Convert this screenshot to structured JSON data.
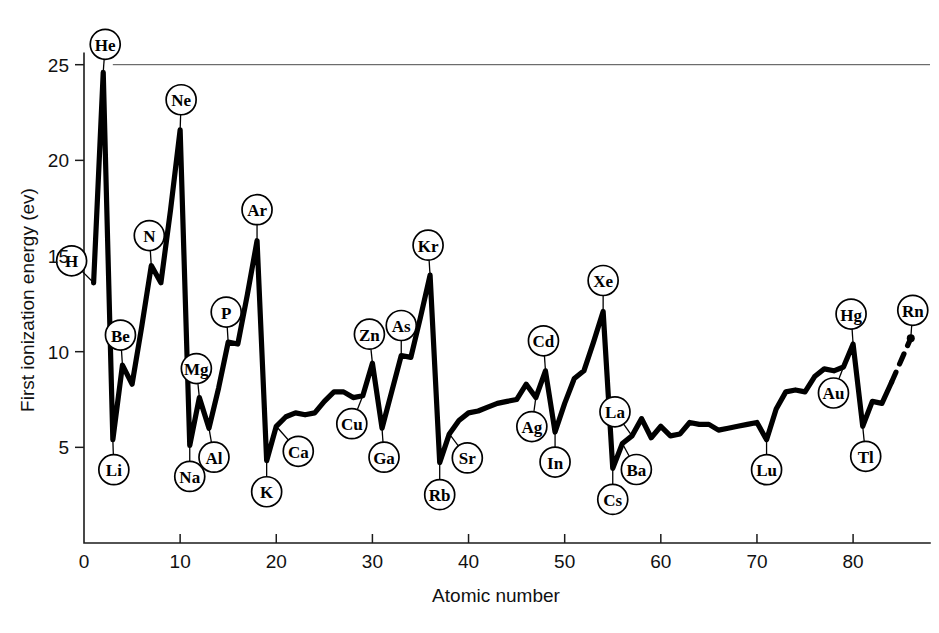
{
  "chart_data": {
    "type": "line",
    "title": "",
    "xlabel": "Atomic number",
    "ylabel": "First ionization energy (ev)",
    "xlim": [
      0,
      88
    ],
    "ylim": [
      0,
      26.5
    ],
    "xticks": [
      0,
      10,
      20,
      30,
      40,
      50,
      60,
      70,
      80
    ],
    "yticks": [
      5,
      10,
      15,
      20,
      25
    ],
    "xticklabels": [
      "0",
      "10",
      "20",
      "30",
      "40",
      "50",
      "60",
      "70",
      "80"
    ],
    "yticklabels": [
      "5",
      "10",
      "15",
      "20",
      "25"
    ],
    "grid": false,
    "legend": null,
    "reference_line": {
      "y": 25,
      "x_from": 3,
      "x_to": 88,
      "style": "thin-solid"
    },
    "series": [
      {
        "name": "First ionization energy",
        "style": "solid",
        "x": [
          1,
          2,
          3,
          4,
          5,
          6,
          7,
          8,
          9,
          10,
          11,
          12,
          13,
          14,
          15,
          16,
          17,
          18,
          19,
          20,
          21,
          22,
          23,
          24,
          25,
          26,
          27,
          28,
          29,
          30,
          31,
          32,
          33,
          34,
          35,
          36,
          37,
          38,
          39,
          40,
          41,
          42,
          43,
          44,
          45,
          46,
          47,
          48,
          49,
          50,
          51,
          52,
          53,
          54,
          55,
          56,
          57,
          58,
          59,
          60,
          61,
          62,
          63,
          64,
          65,
          66,
          67,
          68,
          69,
          70,
          71,
          72,
          73,
          74,
          75,
          76,
          77,
          78,
          79,
          80,
          81,
          82,
          83,
          84
        ],
        "y": [
          13.6,
          24.6,
          5.4,
          9.3,
          8.3,
          11.3,
          14.5,
          13.6,
          17.4,
          21.6,
          5.1,
          7.6,
          6.0,
          8.1,
          10.5,
          10.4,
          13.0,
          15.8,
          4.3,
          6.1,
          6.6,
          6.8,
          6.7,
          6.8,
          7.4,
          7.9,
          7.9,
          7.6,
          7.7,
          9.4,
          6.0,
          7.9,
          9.8,
          9.7,
          11.8,
          14.0,
          4.2,
          5.7,
          6.4,
          6.8,
          6.9,
          7.1,
          7.3,
          7.4,
          7.5,
          8.3,
          7.6,
          9.0,
          5.8,
          7.3,
          8.6,
          9.0,
          10.5,
          12.1,
          3.9,
          5.2,
          5.6,
          6.5,
          5.5,
          6.1,
          5.6,
          5.7,
          6.3,
          6.2,
          6.2,
          5.9,
          6.0,
          6.1,
          6.2,
          6.3,
          5.4,
          7.0,
          7.9,
          8.0,
          7.9,
          8.7,
          9.1,
          9.0,
          9.2,
          10.4,
          6.1,
          7.4,
          7.3,
          8.4
        ]
      },
      {
        "name": "Extrapolation to radon",
        "style": "dashed",
        "x": [
          84,
          86
        ],
        "y": [
          8.4,
          10.7
        ]
      }
    ],
    "point_labels": [
      {
        "element": "H",
        "atomic_number": 1,
        "energy": 13.6,
        "label_dx": -22,
        "label_dy": -22
      },
      {
        "element": "He",
        "atomic_number": 2,
        "energy": 24.6,
        "label_dx": 2,
        "label_dy": -28
      },
      {
        "element": "Li",
        "atomic_number": 3,
        "energy": 5.4,
        "label_dx": 1,
        "label_dy": 30
      },
      {
        "element": "Be",
        "atomic_number": 4,
        "energy": 9.3,
        "label_dx": -2,
        "label_dy": -30
      },
      {
        "element": "N",
        "atomic_number": 7,
        "energy": 14.5,
        "label_dx": -2,
        "label_dy": -30
      },
      {
        "element": "Ne",
        "atomic_number": 10,
        "energy": 21.6,
        "label_dx": 1,
        "label_dy": -30
      },
      {
        "element": "Na",
        "atomic_number": 11,
        "energy": 5.1,
        "label_dx": 0,
        "label_dy": 31
      },
      {
        "element": "Mg",
        "atomic_number": 12,
        "energy": 7.6,
        "label_dx": -3,
        "label_dy": -29
      },
      {
        "element": "Al",
        "atomic_number": 13,
        "energy": 6.0,
        "label_dx": 5,
        "label_dy": 29
      },
      {
        "element": "P",
        "atomic_number": 15,
        "energy": 10.5,
        "label_dx": -2,
        "label_dy": -30
      },
      {
        "element": "Ar",
        "atomic_number": 18,
        "energy": 15.8,
        "label_dx": 0,
        "label_dy": -31
      },
      {
        "element": "K",
        "atomic_number": 19,
        "energy": 4.3,
        "label_dx": 0,
        "label_dy": 31
      },
      {
        "element": "Ca",
        "atomic_number": 20,
        "energy": 6.1,
        "label_dx": 22,
        "label_dy": 25
      },
      {
        "element": "Cu",
        "atomic_number": 29,
        "energy": 7.7,
        "label_dx": -11,
        "label_dy": 28
      },
      {
        "element": "Zn",
        "atomic_number": 30,
        "energy": 9.4,
        "label_dx": -3,
        "label_dy": -29
      },
      {
        "element": "Ga",
        "atomic_number": 31,
        "energy": 6.0,
        "label_dx": 2,
        "label_dy": 29
      },
      {
        "element": "As",
        "atomic_number": 33,
        "energy": 9.8,
        "label_dx": 0,
        "label_dy": -30
      },
      {
        "element": "Kr",
        "atomic_number": 36,
        "energy": 14.0,
        "label_dx": -2,
        "label_dy": -30
      },
      {
        "element": "Rb",
        "atomic_number": 37,
        "energy": 4.2,
        "label_dx": 0,
        "label_dy": 32
      },
      {
        "element": "Sr",
        "atomic_number": 38,
        "energy": 5.7,
        "label_dx": 18,
        "label_dy": 24
      },
      {
        "element": "Ag",
        "atomic_number": 47,
        "energy": 7.6,
        "label_dx": -4,
        "label_dy": 29
      },
      {
        "element": "Cd",
        "atomic_number": 48,
        "energy": 9.0,
        "label_dx": -2,
        "label_dy": -30
      },
      {
        "element": "In",
        "atomic_number": 49,
        "energy": 5.8,
        "label_dx": 0,
        "label_dy": 30
      },
      {
        "element": "Xe",
        "atomic_number": 54,
        "energy": 12.1,
        "label_dx": 0,
        "label_dy": -31
      },
      {
        "element": "Cs",
        "atomic_number": 55,
        "energy": 3.9,
        "label_dx": 0,
        "label_dy": 31
      },
      {
        "element": "Ba",
        "atomic_number": 56,
        "energy": 5.2,
        "label_dx": 14,
        "label_dy": 26
      },
      {
        "element": "La",
        "atomic_number": 57,
        "energy": 5.6,
        "label_dx": -17,
        "label_dy": -24
      },
      {
        "element": "Lu",
        "atomic_number": 71,
        "energy": 5.4,
        "label_dx": 0,
        "label_dy": 30
      },
      {
        "element": "Au",
        "atomic_number": 79,
        "energy": 9.2,
        "label_dx": -10,
        "label_dy": 26
      },
      {
        "element": "Hg",
        "atomic_number": 80,
        "energy": 10.4,
        "label_dx": -2,
        "label_dy": -30
      },
      {
        "element": "Tl",
        "atomic_number": 81,
        "energy": 6.1,
        "label_dx": 3,
        "label_dy": 30
      },
      {
        "element": "Rn",
        "atomic_number": 86,
        "energy": 10.7,
        "label_dx": 2,
        "label_dy": -28
      }
    ]
  }
}
